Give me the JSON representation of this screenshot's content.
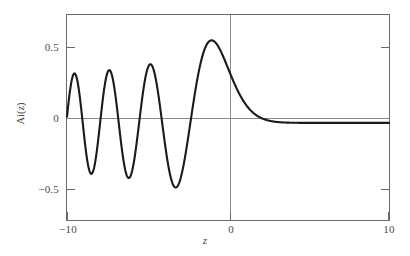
{
  "chart_data": {
    "type": "line",
    "title": "",
    "xlabel": "z",
    "ylabel": "Ai(z)",
    "xlim": [
      -10,
      10
    ],
    "ylim": [
      -0.63,
      0.7
    ],
    "grid": false,
    "legend": null,
    "series": [
      {
        "name": "Ai(z)",
        "color": "#1a1a1a",
        "x": [
          -10.0,
          -9.8,
          -9.6,
          -9.4,
          -9.2,
          -9.0,
          -8.8,
          -8.6,
          -8.4,
          -8.2,
          -8.0,
          -7.8,
          -7.6,
          -7.4,
          -7.2,
          -7.0,
          -6.8,
          -6.6,
          -6.4,
          -6.2,
          -6.0,
          -5.8,
          -5.6,
          -5.4,
          -5.2,
          -5.0,
          -4.8,
          -4.6,
          -4.4,
          -4.2,
          -4.0,
          -3.8,
          -3.6,
          -3.4,
          -3.2,
          -3.0,
          -2.8,
          -2.6,
          -2.4,
          -2.2,
          -2.0,
          -1.8,
          -1.6,
          -1.4,
          -1.2,
          -1.0,
          -0.8,
          -0.6,
          -0.4,
          -0.2,
          0.0,
          0.2,
          0.4,
          0.6,
          0.8,
          1.0,
          1.2,
          1.4,
          1.6,
          1.8,
          2.0,
          2.2,
          2.4,
          2.6,
          2.8,
          3.0,
          3.5,
          4.0,
          4.5,
          5.0,
          6.0,
          7.0,
          8.0,
          9.0,
          10.0
        ],
        "y": [
          0.0408,
          0.1939,
          0.298,
          0.3286,
          0.2776,
          0.1558,
          -0.0087,
          -0.1734,
          -0.2944,
          -0.3352,
          -0.2822,
          -0.1505,
          0.0337,
          0.2139,
          0.3338,
          0.3491,
          0.2507,
          0.0706,
          -0.1334,
          -0.2897,
          -0.3299,
          -0.2322,
          -0.0324,
          0.1825,
          0.3235,
          0.3507,
          0.2609,
          0.0746,
          -0.1374,
          -0.3068,
          -0.3419,
          -0.2173,
          0.0031,
          0.2273,
          0.3542,
          0.3293,
          0.1587,
          -0.0881,
          -0.3037,
          -0.3834,
          -0.2274,
          0.0827,
          0.3594,
          0.4556,
          0.3262,
          0.5356,
          0.5231,
          0.4692,
          0.4012,
          0.3303,
          0.355,
          0.3037,
          0.2547,
          0.21,
          0.1706,
          0.1353,
          0.1062,
          0.082,
          0.0623,
          0.0465,
          0.0349,
          0.0254,
          0.0182,
          0.0129,
          0.009,
          0.0065,
          0.0026,
          0.001,
          0.0004,
          0.0001,
          0.0,
          0.0,
          0.0,
          0.0,
          0.0
        ]
      }
    ],
    "xticks": [
      {
        "value": -10,
        "label": "−10"
      },
      {
        "value": 0,
        "label": "0"
      },
      {
        "value": 10,
        "label": "10"
      }
    ],
    "yticks": [
      {
        "value": 0.5,
        "label": "0.5"
      },
      {
        "value": 0.0,
        "label": "0"
      },
      {
        "value": -0.5,
        "label": "−0.5"
      }
    ],
    "axis_lines": {
      "horizontal_zero": true,
      "vertical_zero": true,
      "color": "#808080"
    },
    "frame_color": "#6a6a6a",
    "background": "#ffffff"
  }
}
